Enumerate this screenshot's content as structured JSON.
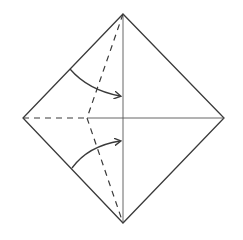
{
  "diagram": {
    "type": "origami-fold-step",
    "background": "#ffffff",
    "stroke_color": "#3a3a3a",
    "thin_stroke_color": "#555555",
    "square": {
      "top": [
        123,
        14
      ],
      "right": [
        224,
        118
      ],
      "bottom": [
        123,
        223
      ],
      "left": [
        23,
        118
      ]
    },
    "crease_lines": [
      {
        "name": "vertical-center-crease",
        "from": [
          123,
          14
        ],
        "to": [
          123,
          223
        ]
      },
      {
        "name": "horizontal-center-crease",
        "from": [
          87,
          118
        ],
        "to": [
          224,
          118
        ]
      }
    ],
    "valley_fold_lines": [
      {
        "name": "left-horizontal-valley-fold",
        "from": [
          23,
          118
        ],
        "to": [
          87,
          118
        ]
      },
      {
        "name": "upper-diagonal-valley-fold",
        "from": [
          123,
          14
        ],
        "to": [
          87,
          118
        ]
      },
      {
        "name": "lower-diagonal-valley-fold",
        "from": [
          87,
          118
        ],
        "to": [
          123,
          223
        ]
      }
    ],
    "arrows": [
      {
        "name": "upper-fold-arrow",
        "from": [
          70,
          69
        ],
        "control": [
          88,
          90
        ],
        "to": [
          120,
          96
        ]
      },
      {
        "name": "lower-fold-arrow",
        "from": [
          72,
          168
        ],
        "control": [
          88,
          146
        ],
        "to": [
          120,
          141
        ]
      }
    ]
  }
}
